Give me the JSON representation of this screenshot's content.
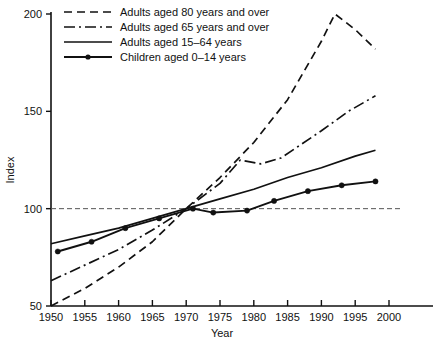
{
  "chart_data": {
    "type": "line",
    "title": "",
    "xlabel": "Year",
    "ylabel": "Index",
    "xlim": [
      1950,
      2002
    ],
    "ylim": [
      50,
      200
    ],
    "grid": false,
    "reference_line": {
      "value": 100,
      "style": "dashed"
    },
    "legend_position": "top-left",
    "x_ticks": [
      "1950",
      "1955",
      "1960",
      "1965",
      "1970",
      "1975",
      "1980",
      "1985",
      "1990",
      "1995",
      "2000"
    ],
    "y_ticks": [
      "50",
      "100",
      "150",
      "200"
    ],
    "series": [
      {
        "name": "Adults aged 80 years and over",
        "style": "dashed",
        "markers": false,
        "x": [
          1950,
          1955,
          1960,
          1965,
          1970,
          1975,
          1980,
          1985,
          1990,
          1992,
          1995,
          1998
        ],
        "values": [
          50,
          59,
          70,
          83,
          100,
          116,
          134,
          156,
          186,
          200,
          192,
          182
        ]
      },
      {
        "name": "Adults aged 65 years and over",
        "style": "dash-dot",
        "markers": false,
        "x": [
          1950,
          1955,
          1960,
          1965,
          1970,
          1975,
          1978,
          1981,
          1984,
          1987,
          1990,
          1994,
          1998
        ],
        "values": [
          63,
          71,
          79,
          89,
          100,
          113,
          125,
          123,
          126,
          133,
          140,
          150,
          158
        ]
      },
      {
        "name": "Adults aged 15–64 years",
        "style": "solid",
        "markers": false,
        "x": [
          1950,
          1955,
          1960,
          1965,
          1970,
          1975,
          1980,
          1985,
          1990,
          1995,
          1998
        ],
        "values": [
          82,
          86,
          90,
          95,
          100,
          105,
          110,
          116,
          121,
          127,
          130
        ]
      },
      {
        "name": "Children aged 0–14 years",
        "style": "solid",
        "markers": true,
        "x": [
          1951,
          1956,
          1961,
          1966,
          1971,
          1974,
          1979,
          1983,
          1988,
          1993,
          1998
        ],
        "values": [
          78,
          83,
          90,
          95,
          100,
          98,
          99,
          104,
          109,
          112,
          114
        ]
      }
    ]
  },
  "legend": {
    "items": [
      {
        "label": "Adults aged 80 years and over",
        "key": "adults-80-plus"
      },
      {
        "label": "Adults aged 65 years and over",
        "key": "adults-65-plus"
      },
      {
        "label": "Adults aged 15–64 years",
        "key": "adults-15-64"
      },
      {
        "label": "Children aged 0–14 years",
        "key": "children-0-14"
      }
    ]
  },
  "axes": {
    "y_title": "Index",
    "x_title": "Year"
  },
  "colors": {
    "line": "#111111",
    "axis": "#111111",
    "reference": "#555555",
    "background": "#ffffff"
  }
}
